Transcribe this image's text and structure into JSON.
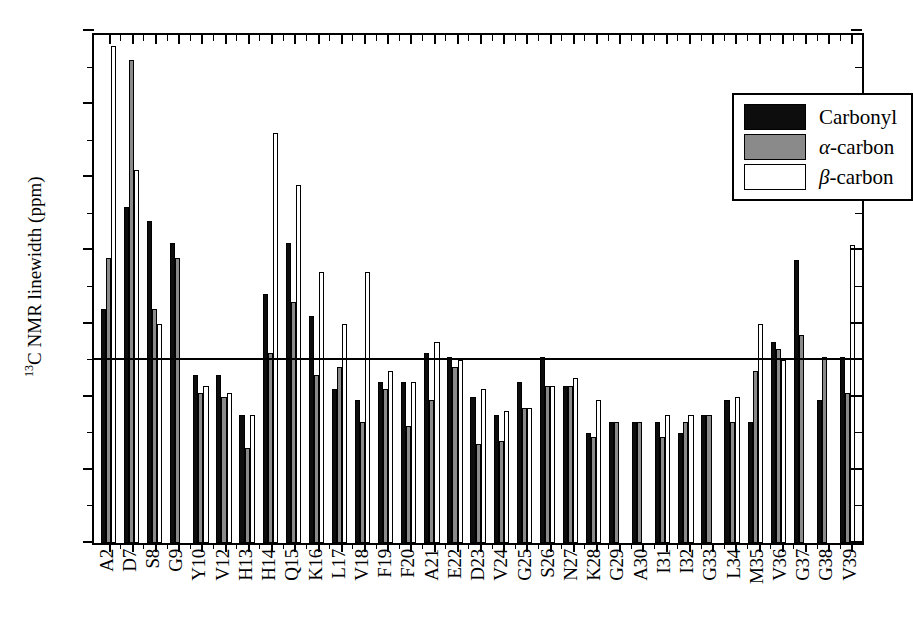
{
  "chart_data": {
    "type": "bar",
    "title": "",
    "xlabel": "",
    "ylabel_html": "13C NMR linewidth (ppm)",
    "ylabel_sup": "13",
    "ylabel_rest": "C NMR linewidth (ppm)",
    "ylim": [
      0,
      7
    ],
    "ytick_labels": [
      "7",
      "6",
      "5",
      "4",
      "3",
      "2",
      "1",
      "0"
    ],
    "ytick_values": [
      7,
      6,
      5,
      4,
      3,
      2,
      1,
      0
    ],
    "yminor_step": 0.5,
    "grid": false,
    "reference_line": 2.5,
    "legend_position": "top-right",
    "categories": [
      "A2",
      "D7",
      "S8",
      "G9",
      "Y10",
      "V12",
      "H13",
      "H14",
      "Q15",
      "K16",
      "L17",
      "V18",
      "F19",
      "F20",
      "A21",
      "E22",
      "D23",
      "V24",
      "G25",
      "S26",
      "N27",
      "K28",
      "G29",
      "A30",
      "I31",
      "I32",
      "G33",
      "L34",
      "M35",
      "V36",
      "G37",
      "G38",
      "V39"
    ],
    "series": [
      {
        "name": "Carbonyl",
        "color": "#0d0d0d",
        "values": [
          3.2,
          4.6,
          4.4,
          4.1,
          2.3,
          2.3,
          1.75,
          3.4,
          4.1,
          3.1,
          2.1,
          1.95,
          2.2,
          2.2,
          2.6,
          2.55,
          2.0,
          1.75,
          2.2,
          2.55,
          2.15,
          1.5,
          1.65,
          1.65,
          1.65,
          1.5,
          1.75,
          1.95,
          1.65,
          2.75,
          3.87,
          1.95,
          2.55
        ]
      },
      {
        "name": "α-carbon",
        "color": "#8a8a8a",
        "values": [
          3.9,
          6.6,
          3.2,
          3.9,
          2.05,
          2.0,
          1.3,
          2.6,
          3.3,
          2.3,
          2.4,
          1.65,
          2.1,
          1.6,
          1.95,
          2.4,
          1.35,
          1.4,
          1.85,
          2.15,
          2.15,
          1.45,
          1.65,
          1.65,
          1.45,
          1.65,
          1.75,
          1.65,
          2.35,
          2.65,
          2.85,
          2.55,
          2.05
        ]
      },
      {
        "name": "β-carbon",
        "color": "#ffffff",
        "values": [
          6.8,
          5.1,
          3.0,
          null,
          2.15,
          2.05,
          1.75,
          5.6,
          4.9,
          3.7,
          3.0,
          3.7,
          2.35,
          2.2,
          2.75,
          2.5,
          2.1,
          1.8,
          1.85,
          2.15,
          2.25,
          1.95,
          null,
          null,
          1.75,
          1.75,
          null,
          2.0,
          3.0,
          2.5,
          null,
          null,
          4.08
        ]
      }
    ]
  },
  "legend": {
    "items": [
      {
        "label": "Carbonyl",
        "italic_prefix": "",
        "swatch": "carbonyl"
      },
      {
        "label": "-carbon",
        "italic_prefix": "α",
        "swatch": "alpha"
      },
      {
        "label": "-carbon",
        "italic_prefix": "β",
        "swatch": "beta"
      }
    ]
  }
}
